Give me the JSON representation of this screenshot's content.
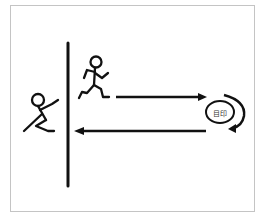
{
  "diagram": {
    "marker": {
      "label": "目印",
      "icon": "circle-marker-icon"
    },
    "figures": [
      {
        "name": "waiting-figure",
        "icon": "stick-figure-standing-icon"
      },
      {
        "name": "running-figure",
        "icon": "stick-figure-running-icon"
      }
    ],
    "arrows": [
      {
        "direction": "right",
        "meaning": "run to marker"
      },
      {
        "direction": "turn",
        "meaning": "turn around marker"
      },
      {
        "direction": "left",
        "meaning": "return to wall"
      }
    ],
    "colors": {
      "stroke": "#111111",
      "border": "#c4c4c4",
      "background": "#ffffff"
    }
  }
}
